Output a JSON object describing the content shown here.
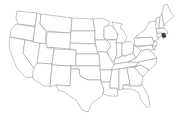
{
  "map": {
    "title": "United States",
    "highlight_color": "#3a3a3a",
    "outline_color": "#8a8a8a",
    "background": "#ffffff",
    "highlighted_states": [
      "RI"
    ],
    "states": [
      {
        "id": "WA",
        "name": "Washington",
        "d": "M17,11 L37,13 L35,26 L18,24 L16,18 Z"
      },
      {
        "id": "OR",
        "name": "Oregon",
        "d": "M16,24 L35,27 L33,41 L10,37 L11,30 Z"
      },
      {
        "id": "CA",
        "name": "California",
        "d": "M10,37 L25,40 L23,53 L34,68 L33,77 L26,78 L17,68 L12,56 L9,46 Z"
      },
      {
        "id": "NV",
        "name": "Nevada",
        "d": "M25,40 L40,43 L37,67 L34,68 L23,53 Z"
      },
      {
        "id": "ID",
        "name": "Idaho",
        "d": "M37,13 L41,14 L40,24 L46,32 L45,44 L33,42 L35,27 Z"
      },
      {
        "id": "MT",
        "name": "Montana",
        "d": "M41,14 L72,18 L71,33 L47,31 L40,24 Z"
      },
      {
        "id": "WY",
        "name": "Wyoming",
        "d": "M47,32 L71,33 L70,49 L46,47 Z"
      },
      {
        "id": "UT",
        "name": "Utah",
        "d": "M40,43 L47,44 L47,48 L54,48 L52,64 L37,63 Z"
      },
      {
        "id": "AZ",
        "name": "Arizona",
        "d": "M37,63 L52,64 L50,86 L44,86 L33,79 L33,70 Z"
      },
      {
        "id": "CO",
        "name": "Colorado",
        "d": "M54,49 L76,50 L76,66 L52,65 Z"
      },
      {
        "id": "NM",
        "name": "New Mexico",
        "d": "M52,65 L71,66 L70,86 L56,85 L50,87 Z"
      },
      {
        "id": "ND",
        "name": "North Dakota",
        "d": "M72,18 L93,19 L95,31 L71,31 Z"
      },
      {
        "id": "SD",
        "name": "South Dakota",
        "d": "M71,31 L95,31 L95,44 L70,43 Z"
      },
      {
        "id": "NE",
        "name": "Nebraska",
        "d": "M70,43 L95,44 L99,54 L76,54 L76,50 L70,49 Z"
      },
      {
        "id": "KS",
        "name": "Kansas",
        "d": "M76,54 L99,54 L100,66 L76,66 Z"
      },
      {
        "id": "OK",
        "name": "Oklahoma",
        "d": "M71,66 L100,66 L101,80 L88,80 L80,76 L79,69 L71,69 Z"
      },
      {
        "id": "TX",
        "name": "Texas",
        "d": "M71,69 L79,69 L80,76 L88,80 L101,80 L104,90 L102,96 L92,103 L88,112 L82,110 L76,100 L70,96 L64,92 L58,90 L56,85 L70,86 Z"
      },
      {
        "id": "MN",
        "name": "Minnesota",
        "d": "M93,19 L101,18 L110,22 L104,29 L104,38 L107,40 L95,40 L95,31 Z"
      },
      {
        "id": "IA",
        "name": "Iowa",
        "d": "M95,40 L107,40 L111,46 L107,52 L97,52 Z"
      },
      {
        "id": "MO",
        "name": "Missouri",
        "d": "M97,52 L107,52 L110,58 L114,65 L112,70 L100,70 L100,66 L99,54 Z"
      },
      {
        "id": "AR",
        "name": "Arkansas",
        "d": "M100,70 L112,70 L110,82 L101,82 L101,80 Z"
      },
      {
        "id": "LA",
        "name": "Louisiana",
        "d": "M101,82 L110,82 L110,88 L117,88 L118,96 L110,96 L103,94 L104,90 Z"
      },
      {
        "id": "WI",
        "name": "Wisconsin",
        "d": "M104,27 L110,25 L117,31 L118,39 L107,40 L104,38 Z"
      },
      {
        "id": "IL",
        "name": "Illinois",
        "d": "M107,40 L116,40 L117,54 L114,62 L110,58 L107,52 L111,46 Z"
      },
      {
        "id": "MI",
        "name": "Michigan",
        "d": "M112,22 L122,24 L120,28 L124,31 L127,38 L124,43 L116,43 L118,34 L114,28 Z"
      },
      {
        "id": "IN",
        "name": "Indiana",
        "d": "M116,43 L122,43 L122,56 L115,59 L117,54 Z"
      },
      {
        "id": "OH",
        "name": "Ohio",
        "d": "M122,43 L130,41 L134,45 L133,53 L126,56 L122,55 Z"
      },
      {
        "id": "KY",
        "name": "Kentucky",
        "d": "M114,62 L115,59 L122,56 L126,56 L133,53 L136,58 L128,62 L115,64 Z"
      },
      {
        "id": "TN",
        "name": "Tennessee",
        "d": "M112,67 L115,64 L128,62 L139,62 L136,66 L112,70 Z"
      },
      {
        "id": "MS",
        "name": "Mississippi",
        "d": "M112,70 L119,69 L119,90 L117,90 L117,88 L110,88 L110,82 Z"
      },
      {
        "id": "AL",
        "name": "Alabama",
        "d": "M119,69 L127,68 L130,84 L123,85 L123,89 L119,90 Z"
      },
      {
        "id": "GA",
        "name": "Georgia",
        "d": "M127,68 L134,67 L143,77 L141,86 L130,86 L130,84 Z"
      },
      {
        "id": "FL",
        "name": "Florida",
        "d": "M123,85 L130,86 L141,86 L142,84 L148,96 L150,106 L147,108 L141,100 L138,92 L131,89 L123,89 Z"
      },
      {
        "id": "SC",
        "name": "South Carolina",
        "d": "M134,67 L141,65 L149,70 L143,77 Z"
      },
      {
        "id": "NC",
        "name": "North Carolina",
        "d": "M136,66 L139,62 L157,58 L156,64 L149,70 L141,65 L134,67 Z"
      },
      {
        "id": "VA",
        "name": "Virginia",
        "d": "M128,62 L136,58 L141,51 L148,49 L153,53 L157,58 L139,62 Z"
      },
      {
        "id": "WV",
        "name": "West Virginia",
        "d": "M133,53 L134,45 L137,47 L141,51 L136,58 Z"
      },
      {
        "id": "PA",
        "name": "Pennsylvania",
        "d": "M134,38 L152,37 L154,43 L152,45 L135,46 Z"
      },
      {
        "id": "NY",
        "name": "New York",
        "d": "M136,36 L145,30 L149,22 L156,21 L157,33 L159,39 L154,41 L152,37 L136,38 Z"
      },
      {
        "id": "MD",
        "name": "Maryland",
        "d": "M137,47 L152,45 L154,50 L150,50 L148,49 L141,51 Z"
      },
      {
        "id": "DE",
        "name": "Delaware",
        "d": "M152,45 L155,46 L155,50 L154,50 Z"
      },
      {
        "id": "NJ",
        "name": "New Jersey",
        "d": "M154,41 L157,42 L156,47 L155,46 L152,45 L154,43 Z"
      },
      {
        "id": "CT",
        "name": "Connecticut",
        "d": "M157,33 L162,33 L162,36 L157,38 Z"
      },
      {
        "id": "RI",
        "name": "Rhode Island",
        "d": "M162,33 L165,33 L166,37 L163,38 L162,36 Z"
      },
      {
        "id": "MA",
        "name": "Massachusetts",
        "d": "M156,29 L163,28 L166,29 L168,33 L166,34 L165,33 L162,33 L157,33 Z"
      },
      {
        "id": "VT",
        "name": "Vermont",
        "d": "M156,18 L160,17 L159,28 L156,29 Z"
      },
      {
        "id": "NH",
        "name": "New Hampshire",
        "d": "M160,17 L162,13 L164,26 L163,28 L159,28 Z"
      },
      {
        "id": "ME",
        "name": "Maine",
        "d": "M162,13 L164,5 L167,4 L171,13 L174,16 L167,22 L164,26 Z"
      }
    ]
  }
}
